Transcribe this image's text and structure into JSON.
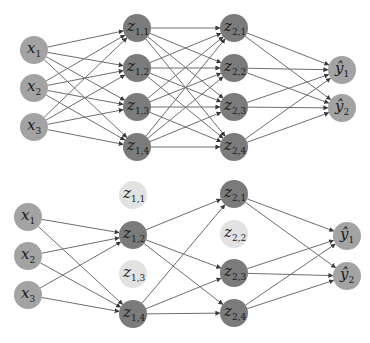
{
  "colors": {
    "io_node": "#a3a3a3",
    "hidden_node": "#7b7b7b",
    "dropped_node": "#e2e2e2",
    "edge": "#6e6e6e"
  },
  "networks": [
    {
      "name": "standard-network",
      "nodes": [
        {
          "id": "x1",
          "label": "x",
          "sub": "1",
          "cx": 34,
          "cy": 50,
          "kind": "io"
        },
        {
          "id": "x2",
          "label": "x",
          "sub": "2",
          "cx": 34,
          "cy": 88,
          "kind": "io"
        },
        {
          "id": "x3",
          "label": "x",
          "sub": "3",
          "cx": 34,
          "cy": 127,
          "kind": "io"
        },
        {
          "id": "z11",
          "label": "z",
          "sub": "1,1",
          "cx": 137,
          "cy": 28,
          "kind": "hidden"
        },
        {
          "id": "z12",
          "label": "z",
          "sub": "1,2",
          "cx": 137,
          "cy": 68,
          "kind": "hidden"
        },
        {
          "id": "z13",
          "label": "z",
          "sub": "1,3",
          "cx": 137,
          "cy": 107,
          "kind": "hidden"
        },
        {
          "id": "z14",
          "label": "z",
          "sub": "1,4",
          "cx": 137,
          "cy": 147,
          "kind": "hidden"
        },
        {
          "id": "z21",
          "label": "z",
          "sub": "2,1",
          "cx": 234,
          "cy": 28,
          "kind": "hidden"
        },
        {
          "id": "z22",
          "label": "z",
          "sub": "2,2",
          "cx": 234,
          "cy": 68,
          "kind": "hidden"
        },
        {
          "id": "z23",
          "label": "z",
          "sub": "2,3",
          "cx": 234,
          "cy": 107,
          "kind": "hidden"
        },
        {
          "id": "z24",
          "label": "z",
          "sub": "2,4",
          "cx": 234,
          "cy": 147,
          "kind": "hidden"
        },
        {
          "id": "y1",
          "label": "ŷ",
          "sub": "1",
          "cx": 342,
          "cy": 70,
          "kind": "io"
        },
        {
          "id": "y2",
          "label": "ŷ",
          "sub": "2",
          "cx": 342,
          "cy": 108,
          "kind": "io"
        }
      ],
      "edges": [
        [
          "x1",
          "z11"
        ],
        [
          "x1",
          "z12"
        ],
        [
          "x1",
          "z13"
        ],
        [
          "x1",
          "z14"
        ],
        [
          "x2",
          "z11"
        ],
        [
          "x2",
          "z12"
        ],
        [
          "x2",
          "z13"
        ],
        [
          "x2",
          "z14"
        ],
        [
          "x3",
          "z11"
        ],
        [
          "x3",
          "z12"
        ],
        [
          "x3",
          "z13"
        ],
        [
          "x3",
          "z14"
        ],
        [
          "z11",
          "z21"
        ],
        [
          "z11",
          "z22"
        ],
        [
          "z11",
          "z23"
        ],
        [
          "z11",
          "z24"
        ],
        [
          "z12",
          "z21"
        ],
        [
          "z12",
          "z22"
        ],
        [
          "z12",
          "z23"
        ],
        [
          "z12",
          "z24"
        ],
        [
          "z13",
          "z21"
        ],
        [
          "z13",
          "z22"
        ],
        [
          "z13",
          "z23"
        ],
        [
          "z13",
          "z24"
        ],
        [
          "z14",
          "z21"
        ],
        [
          "z14",
          "z22"
        ],
        [
          "z14",
          "z23"
        ],
        [
          "z14",
          "z24"
        ],
        [
          "z21",
          "y1"
        ],
        [
          "z21",
          "y2"
        ],
        [
          "z22",
          "y1"
        ],
        [
          "z22",
          "y2"
        ],
        [
          "z23",
          "y1"
        ],
        [
          "z23",
          "y2"
        ],
        [
          "z24",
          "y1"
        ],
        [
          "z24",
          "y2"
        ]
      ]
    },
    {
      "name": "dropout-network",
      "nodes": [
        {
          "id": "x1",
          "label": "x",
          "sub": "1",
          "cx": 28,
          "cy": 217,
          "kind": "io"
        },
        {
          "id": "x2",
          "label": "x",
          "sub": "2",
          "cx": 28,
          "cy": 256,
          "kind": "io"
        },
        {
          "id": "x3",
          "label": "x",
          "sub": "3",
          "cx": 28,
          "cy": 295,
          "kind": "io"
        },
        {
          "id": "z11",
          "label": "z",
          "sub": "1,1",
          "cx": 133,
          "cy": 195,
          "kind": "dropped"
        },
        {
          "id": "z12",
          "label": "z",
          "sub": "1,2",
          "cx": 133,
          "cy": 235,
          "kind": "hidden"
        },
        {
          "id": "z13",
          "label": "z",
          "sub": "1,3",
          "cx": 133,
          "cy": 274,
          "kind": "dropped"
        },
        {
          "id": "z14",
          "label": "z",
          "sub": "1,4",
          "cx": 133,
          "cy": 314,
          "kind": "hidden"
        },
        {
          "id": "z21",
          "label": "z",
          "sub": "2,1",
          "cx": 234,
          "cy": 194,
          "kind": "hidden"
        },
        {
          "id": "z22",
          "label": "z",
          "sub": "2,2",
          "cx": 234,
          "cy": 234,
          "kind": "dropped"
        },
        {
          "id": "z23",
          "label": "z",
          "sub": "2,3",
          "cx": 234,
          "cy": 273,
          "kind": "hidden"
        },
        {
          "id": "z24",
          "label": "z",
          "sub": "2,4",
          "cx": 234,
          "cy": 313,
          "kind": "hidden"
        },
        {
          "id": "y1",
          "label": "ŷ",
          "sub": "1",
          "cx": 347,
          "cy": 236,
          "kind": "io"
        },
        {
          "id": "y2",
          "label": "ŷ",
          "sub": "2",
          "cx": 347,
          "cy": 276,
          "kind": "io"
        }
      ],
      "edges": [
        [
          "x1",
          "z12"
        ],
        [
          "x1",
          "z14"
        ],
        [
          "x2",
          "z12"
        ],
        [
          "x2",
          "z14"
        ],
        [
          "x3",
          "z12"
        ],
        [
          "x3",
          "z14"
        ],
        [
          "z12",
          "z21"
        ],
        [
          "z12",
          "z23"
        ],
        [
          "z12",
          "z24"
        ],
        [
          "z14",
          "z21"
        ],
        [
          "z14",
          "z23"
        ],
        [
          "z14",
          "z24"
        ],
        [
          "z21",
          "y1"
        ],
        [
          "z21",
          "y2"
        ],
        [
          "z23",
          "y1"
        ],
        [
          "z23",
          "y2"
        ],
        [
          "z24",
          "y1"
        ],
        [
          "z24",
          "y2"
        ]
      ]
    }
  ]
}
